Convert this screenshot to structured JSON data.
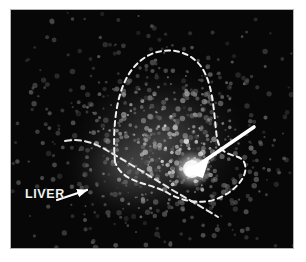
{
  "figure": {
    "kind": "scintigram",
    "modality_caption": "radionuclide liver scan",
    "background_color": "#ffffff",
    "scan_background_color": "#070707",
    "frame_border_color": "#b4b4b4",
    "annotation_color": "#ffffff"
  },
  "annotations": {
    "liver": {
      "label": "LIVER",
      "pointer_name": "liver-arrow"
    },
    "lesion": {
      "pointer_name": "lesion-arrow",
      "pointer_style": "solid-white-arrow"
    },
    "outlines": [
      {
        "name": "organ-outline-dashed",
        "style": "dashed",
        "color": "#ffffff"
      },
      {
        "name": "secondary-outline-dashed",
        "style": "dashed",
        "color": "#ffffff"
      }
    ]
  },
  "scan": {
    "noise": {
      "seed": 20240517,
      "speck_count": 2600,
      "hot_spot_center": [
        181,
        159
      ],
      "hot_spot_radius": 16,
      "uptake_center": [
        150,
        132
      ],
      "uptake_radius_x": 96,
      "uptake_radius_y": 80
    }
  }
}
